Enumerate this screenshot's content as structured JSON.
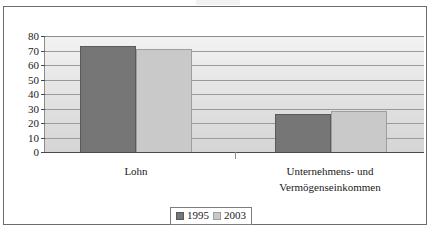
{
  "chart_data": {
    "type": "bar",
    "title": "",
    "xlabel": "",
    "ylabel": "",
    "categories": [
      "Lohn",
      "Unternehmens- und Vermögenseinkommen"
    ],
    "category_lines": [
      [
        "Lohn"
      ],
      [
        "Unternehmens- und",
        "Vermögenseinkommen"
      ]
    ],
    "series": [
      {
        "name": "1995",
        "values": [
          73,
          26
        ],
        "color": "#767676"
      },
      {
        "name": "2003",
        "values": [
          71,
          28
        ],
        "color": "#c9c9c9"
      }
    ],
    "ylim": [
      0,
      80
    ],
    "yticks": [
      0,
      10,
      20,
      30,
      40,
      50,
      60,
      70,
      80
    ],
    "ytick_labels": [
      "0",
      "10",
      "20",
      "30",
      "40",
      "50",
      "60",
      "70",
      "80"
    ],
    "grid": true,
    "grid_axis": "y",
    "legend_position": "bottom-center",
    "plot_background": "#e4e4e4",
    "frame_color": "#6b6b6b"
  },
  "legend": {
    "entries": [
      {
        "label": "1995",
        "swatch": "legend-swatch-1995"
      },
      {
        "label": "2003",
        "swatch": "legend-swatch-2003"
      }
    ]
  }
}
